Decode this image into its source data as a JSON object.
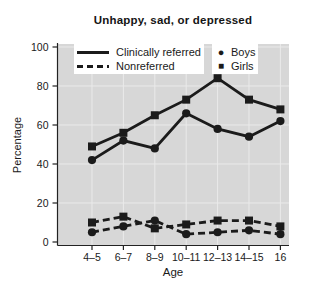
{
  "chart_data": {
    "type": "line",
    "title": "Unhappy, sad, or depressed",
    "xlabel": "Age",
    "ylabel": "Percentage",
    "categories": [
      "4–5",
      "6–7",
      "8–9",
      "10–11",
      "12–13",
      "14–15",
      "16"
    ],
    "yticks": [
      0,
      20,
      40,
      60,
      80,
      100
    ],
    "ylim": [
      0,
      100
    ],
    "grid": true,
    "legend_position": "top-inside",
    "legend": {
      "clinically_referred": "Clinically referred",
      "nonreferred": "Nonreferred",
      "boys": "Boys",
      "girls": "Girls"
    },
    "icons": {
      "boys_marker": "●",
      "girls_marker": "■"
    },
    "series": [
      {
        "name": "Clinically referred – Boys",
        "group": "Clinically referred",
        "sex": "Boys",
        "style": "solid",
        "marker": "circle",
        "values": [
          42,
          52,
          48,
          66,
          58,
          54,
          62
        ]
      },
      {
        "name": "Clinically referred – Girls",
        "group": "Clinically referred",
        "sex": "Girls",
        "style": "solid",
        "marker": "square",
        "values": [
          49,
          56,
          65,
          73,
          84,
          73,
          68
        ]
      },
      {
        "name": "Nonreferred – Boys",
        "group": "Nonreferred",
        "sex": "Boys",
        "style": "dashed",
        "marker": "circle",
        "values": [
          5,
          8,
          11,
          4,
          5,
          6,
          4
        ]
      },
      {
        "name": "Nonreferred – Girls",
        "group": "Nonreferred",
        "sex": "Girls",
        "style": "dashed",
        "marker": "square",
        "values": [
          10,
          13,
          7,
          9,
          11,
          11,
          8
        ]
      }
    ],
    "colors": {
      "line": "#1b1b1b",
      "plot_bg": "#d7d7d7",
      "grid": "#eaeaea",
      "axis": "#222222",
      "text": "#1a1a1a",
      "page_bg": "#ffffff"
    }
  }
}
